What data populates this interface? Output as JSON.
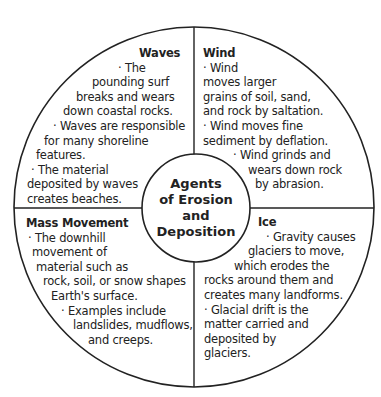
{
  "center": {
    "lines": [
      "Agents",
      "of Erosion",
      "and",
      "Deposition"
    ]
  },
  "quadrants": {
    "waves": {
      "title": "Waves",
      "lines": [
        "· The",
        "pounding surf",
        "breaks and wears",
        "down coastal rocks.",
        "· Waves are responsible",
        "for many shoreline",
        "features.",
        "· The material",
        "deposited by waves",
        "creates beaches."
      ]
    },
    "wind": {
      "title": "Wind",
      "lines": [
        "· Wind",
        "moves larger",
        "grains of soil, sand,",
        "and rock by saltation.",
        "· Wind moves fine",
        "sediment by deflation.",
        "· Wind grinds and",
        "wears down rock",
        "by abrasion."
      ]
    },
    "mass_movement": {
      "title": "Mass Movement",
      "lines": [
        "· The downhill",
        "movement of",
        "material such as",
        "rock, soil, or snow shapes",
        "Earth's surface.",
        "· Examples include",
        "landslides, mudflows,",
        "and creeps."
      ]
    },
    "ice": {
      "title": "Ice",
      "lines": [
        "· Gravity causes",
        "glaciers to move,",
        "which erodes the",
        "rocks around them and",
        "creates many landforms.",
        "· Glacial drift is the",
        "matter carried and",
        "deposited by",
        "glaciers."
      ]
    }
  },
  "colors": {
    "stroke": "#222222",
    "text": "#222222",
    "background": "#ffffff"
  }
}
